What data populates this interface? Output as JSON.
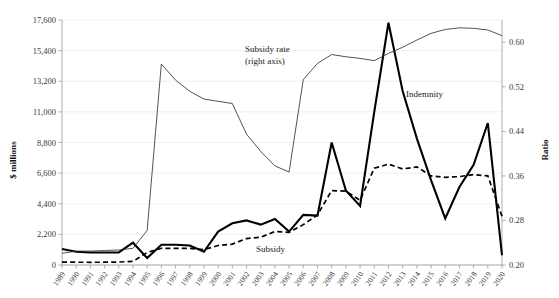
{
  "chart_data": {
    "type": "line",
    "title": "",
    "xlabel": "",
    "ylabel": "$ millions",
    "ylabel_right": "Ratio",
    "ylim": [
      0,
      17600
    ],
    "ylim_right": [
      0.2,
      0.64
    ],
    "grid": true,
    "legend": "annotations",
    "yticks": [
      "0",
      "2,200",
      "4,400",
      "6,600",
      "8,800",
      "11,000",
      "13,200",
      "15,400",
      "17,600"
    ],
    "ytick_values": [
      0,
      2200,
      4400,
      6600,
      8800,
      11000,
      13200,
      15400,
      17600
    ],
    "yticks_right": [
      "0.20",
      "0.28",
      "0.36",
      "0.44",
      "0.52",
      "0.60"
    ],
    "ytick_values_right": [
      0.2,
      0.28,
      0.36,
      0.44,
      0.52,
      0.6
    ],
    "categories": [
      "1989",
      "1990",
      "1991",
      "1992",
      "1993",
      "1994",
      "1995",
      "1996",
      "1997",
      "1998",
      "1999",
      "2000",
      "2001",
      "2002",
      "2003",
      "2004",
      "2005",
      "2006",
      "2007",
      "2008",
      "2009",
      "2010",
      "2011",
      "2012",
      "2013",
      "2014",
      "2015",
      "2016",
      "2017",
      "2018",
      "2019",
      "2020"
    ],
    "annotations": [
      {
        "text": "Subsidy rate",
        "x": 245,
        "y": 52
      },
      {
        "text": "(right axis)",
        "x": 245,
        "y": 64
      },
      {
        "text": "Indemnity",
        "x": 406,
        "y": 97
      },
      {
        "text": "Subsidy",
        "x": 256,
        "y": 252
      }
    ],
    "series": [
      {
        "name": "Indemnity",
        "axis": "left",
        "style": "solid-thick",
        "values": [
          1150,
          950,
          900,
          900,
          900,
          1600,
          500,
          1450,
          1450,
          1400,
          950,
          2400,
          3000,
          3200,
          2900,
          3300,
          2400,
          3600,
          3550,
          8800,
          5350,
          4250,
          11000,
          17400,
          12500,
          9100,
          6100,
          3350,
          5600,
          7200,
          10200,
          700
        ]
      },
      {
        "name": "Subsidy",
        "axis": "left",
        "style": "dashed",
        "values": [
          210,
          200,
          195,
          200,
          215,
          260,
          900,
          1200,
          1200,
          1200,
          1100,
          1400,
          1500,
          1900,
          2000,
          2400,
          2350,
          2900,
          3600,
          5350,
          5300,
          4650,
          6950,
          7250,
          6900,
          7050,
          6400,
          6300,
          6350,
          6500,
          6400,
          3500
        ]
      },
      {
        "name": "Subsidy rate",
        "axis": "right",
        "style": "solid-thin",
        "values": [
          0.221,
          0.225,
          0.225,
          0.226,
          0.227,
          0.23,
          0.262,
          0.561,
          0.532,
          0.512,
          0.498,
          0.494,
          0.49,
          0.435,
          0.404,
          0.378,
          0.367,
          0.533,
          0.562,
          0.578,
          0.574,
          0.571,
          0.567,
          0.58,
          0.591,
          0.604,
          0.616,
          0.623,
          0.626,
          0.625,
          0.622,
          0.612
        ]
      }
    ]
  }
}
